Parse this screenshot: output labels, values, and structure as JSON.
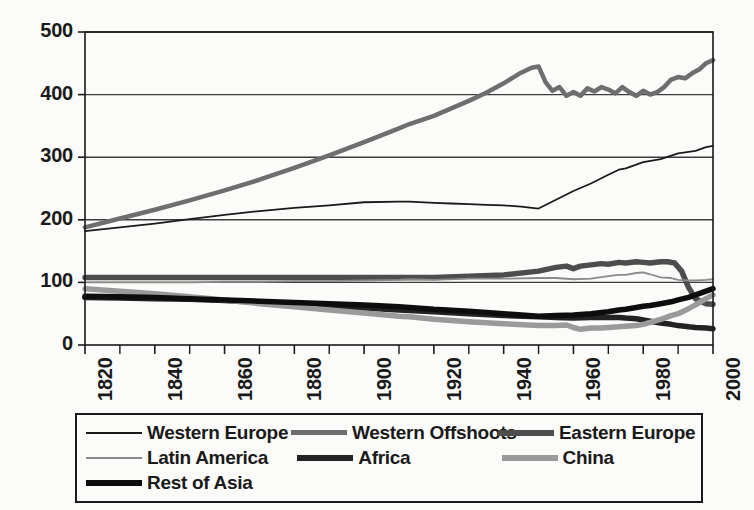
{
  "chart_data": {
    "type": "line",
    "title": "",
    "subtitle": "",
    "xlabel": "",
    "ylabel": "",
    "xlim": [
      1820,
      2000
    ],
    "ylim": [
      0,
      500
    ],
    "grid": true,
    "grid_axis": "y",
    "legend_position": "bottom",
    "x_tick_labels": [
      "1820",
      "1840",
      "1860",
      "1880",
      "1900",
      "1920",
      "1940",
      "1960",
      "1980",
      "2000"
    ],
    "x_tick_values": [
      1820,
      1840,
      1860,
      1880,
      1900,
      1920,
      1940,
      1960,
      1980,
      2000
    ],
    "x_minor_tick_values": [
      1830,
      1850,
      1870,
      1890,
      1910,
      1930,
      1950,
      1970,
      1990
    ],
    "y_tick_labels": [
      "0",
      "100",
      "200",
      "300",
      "400",
      "500"
    ],
    "y_tick_values": [
      0,
      100,
      200,
      300,
      400,
      500
    ],
    "series": [
      {
        "name": "Western Europe",
        "color": "#1a1a1a",
        "width": 1.8,
        "x": [
          1820,
          1830,
          1840,
          1850,
          1860,
          1870,
          1880,
          1890,
          1900,
          1910,
          1913,
          1920,
          1925,
          1930,
          1935,
          1940,
          1945,
          1950,
          1955,
          1960,
          1965,
          1970,
          1973,
          1975,
          1980,
          1985,
          1990,
          1995,
          1998,
          2000
        ],
        "y": [
          182,
          188,
          194,
          201,
          208,
          214,
          219,
          223,
          228,
          229,
          229,
          227,
          226,
          225,
          224,
          223,
          221,
          218,
          232,
          246,
          258,
          272,
          280,
          282,
          292,
          297,
          306,
          310,
          316,
          318
        ]
      },
      {
        "name": "Western Offshoots",
        "color": "#6e6e6e",
        "width": 4.5,
        "x": [
          1820,
          1830,
          1840,
          1850,
          1860,
          1870,
          1880,
          1890,
          1900,
          1910,
          1913,
          1920,
          1925,
          1930,
          1935,
          1940,
          1945,
          1948,
          1950,
          1952,
          1954,
          1956,
          1958,
          1960,
          1962,
          1964,
          1966,
          1968,
          1970,
          1972,
          1974,
          1976,
          1978,
          1980,
          1982,
          1984,
          1986,
          1988,
          1990,
          1992,
          1994,
          1996,
          1998,
          2000
        ],
        "y": [
          188,
          202,
          216,
          231,
          247,
          264,
          283,
          303,
          324,
          346,
          353,
          366,
          378,
          390,
          403,
          418,
          435,
          443,
          445,
          420,
          406,
          412,
          398,
          404,
          398,
          410,
          405,
          412,
          408,
          402,
          412,
          404,
          398,
          406,
          400,
          404,
          412,
          424,
          428,
          426,
          434,
          440,
          450,
          455
        ]
      },
      {
        "name": "Eastern Europe",
        "color": "#4d4d4d",
        "width": 5.5,
        "x": [
          1820,
          1830,
          1840,
          1850,
          1860,
          1870,
          1880,
          1890,
          1900,
          1910,
          1913,
          1920,
          1930,
          1940,
          1950,
          1955,
          1958,
          1960,
          1962,
          1965,
          1968,
          1970,
          1973,
          1975,
          1978,
          1980,
          1982,
          1985,
          1987,
          1989,
          1991,
          1993,
          1995,
          1998,
          2000
        ],
        "y": [
          108,
          108,
          108,
          108,
          108,
          108,
          108,
          108,
          108,
          108,
          108,
          108,
          110,
          112,
          118,
          124,
          126,
          122,
          126,
          128,
          130,
          129,
          132,
          131,
          133,
          132,
          131,
          133,
          133,
          131,
          118,
          92,
          74,
          66,
          65
        ]
      },
      {
        "name": "Latin America",
        "color": "#8a8a8a",
        "width": 1.8,
        "x": [
          1820,
          1830,
          1840,
          1850,
          1860,
          1870,
          1880,
          1890,
          1900,
          1910,
          1913,
          1920,
          1930,
          1940,
          1950,
          1955,
          1960,
          1965,
          1970,
          1973,
          1975,
          1978,
          1980,
          1982,
          1985,
          1988,
          1990,
          1993,
          1995,
          1998,
          2000
        ],
        "y": [
          100,
          100,
          100,
          100,
          101,
          101,
          102,
          102,
          103,
          104,
          105,
          104,
          106,
          106,
          107,
          107,
          105,
          106,
          110,
          112,
          112,
          115,
          116,
          113,
          108,
          107,
          104,
          103,
          103,
          104,
          105
        ]
      },
      {
        "name": "Africa",
        "color": "#232323",
        "width": 5.5,
        "x": [
          1820,
          1830,
          1840,
          1850,
          1860,
          1870,
          1880,
          1890,
          1900,
          1910,
          1913,
          1920,
          1930,
          1940,
          1950,
          1955,
          1960,
          1965,
          1970,
          1973,
          1975,
          1978,
          1980,
          1982,
          1985,
          1988,
          1990,
          1993,
          1995,
          1998,
          2000
        ],
        "y": [
          76,
          75,
          74,
          73,
          71,
          68,
          65,
          62,
          59,
          56,
          55,
          53,
          50,
          47,
          45,
          44,
          43,
          44,
          44,
          44,
          43,
          42,
          40,
          38,
          35,
          33,
          31,
          29,
          28,
          27,
          26
        ]
      },
      {
        "name": "China",
        "color": "#9a9a9a",
        "width": 5.5,
        "x": [
          1820,
          1830,
          1840,
          1850,
          1860,
          1870,
          1880,
          1890,
          1900,
          1910,
          1913,
          1920,
          1930,
          1940,
          1950,
          1955,
          1958,
          1960,
          1962,
          1965,
          1968,
          1970,
          1973,
          1975,
          1978,
          1980,
          1982,
          1985,
          1988,
          1990,
          1993,
          1995,
          1998,
          2000
        ],
        "y": [
          90,
          86,
          82,
          77,
          72,
          66,
          61,
          56,
          51,
          46,
          45,
          41,
          37,
          34,
          31,
          31,
          32,
          28,
          25,
          27,
          27,
          28,
          29,
          30,
          31,
          33,
          36,
          41,
          47,
          50,
          58,
          64,
          74,
          80
        ]
      },
      {
        "name": "Rest of Asia",
        "color": "#0d0d0d",
        "width": 5.5,
        "x": [
          1820,
          1830,
          1840,
          1850,
          1860,
          1870,
          1880,
          1890,
          1900,
          1910,
          1913,
          1920,
          1930,
          1940,
          1950,
          1955,
          1960,
          1965,
          1970,
          1973,
          1975,
          1978,
          1980,
          1982,
          1985,
          1988,
          1990,
          1993,
          1995,
          1998,
          2000
        ],
        "y": [
          78,
          77,
          76,
          74,
          72,
          70,
          68,
          66,
          64,
          61,
          60,
          57,
          54,
          50,
          46,
          47,
          48,
          50,
          53,
          56,
          57,
          60,
          62,
          63,
          66,
          69,
          72,
          76,
          80,
          86,
          90
        ]
      }
    ]
  },
  "legend": {
    "rows": [
      [
        {
          "label": "Western Europe",
          "key": "western-europe"
        },
        {
          "label": "Western Offshoots",
          "key": "western-offshoots"
        },
        {
          "label": "Eastern Europe",
          "key": "eastern-europe"
        }
      ],
      [
        {
          "label": "Latin America",
          "key": "latin-america"
        },
        {
          "label": "Africa",
          "key": "africa"
        },
        {
          "label": "China",
          "key": "china"
        }
      ],
      [
        {
          "label": "Rest of Asia",
          "key": "rest-of-asia"
        }
      ]
    ]
  }
}
